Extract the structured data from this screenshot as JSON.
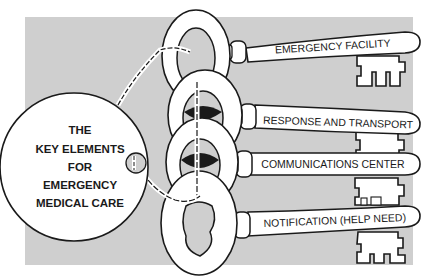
{
  "diagram": {
    "title_lines": [
      "THE",
      "KEY ELEMENTS",
      "FOR",
      "EMERGENCY",
      "MEDICAL CARE"
    ],
    "keys": [
      {
        "label": "EMERGENCY FACILITY"
      },
      {
        "label": "RESPONSE AND TRANSPORT"
      },
      {
        "label": "COMMUNICATIONS CENTER"
      },
      {
        "label": "NOTIFICATION (HELP NEED)"
      }
    ],
    "colors": {
      "background_panel": "#cfcfcf",
      "outline": "#1a1a1a",
      "fill": "#ffffff"
    }
  }
}
